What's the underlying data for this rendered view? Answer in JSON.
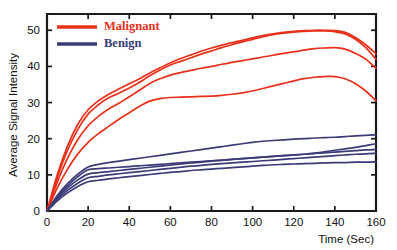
{
  "chart_data": {
    "type": "line",
    "title": "",
    "xlabel": "Time (Sec)",
    "ylabel": "Average Signal Intensity",
    "xlim": [
      0,
      160
    ],
    "ylim": [
      0,
      54.5
    ],
    "xticks": [
      0,
      20,
      40,
      60,
      80,
      100,
      120,
      140,
      160
    ],
    "xticklabels": [
      "0",
      "20",
      "40",
      "60",
      "80",
      "100",
      "120",
      "140",
      "160"
    ],
    "yticks": [
      0,
      10,
      20,
      30,
      40,
      50
    ],
    "yticklabels": [
      "0",
      "10",
      "20",
      "30",
      "40",
      "50"
    ],
    "grid": false,
    "legend_position": "upper left",
    "legend": [
      {
        "name": "Malignant",
        "color": "#E8301A"
      },
      {
        "name": "Benign",
        "color": "#3B3B78"
      }
    ],
    "colors": {
      "malignant": "#E8301A",
      "benign": "#3B3B78",
      "axis": "#1a1a1a",
      "background": "#ffffff"
    },
    "x": [
      0,
      5,
      10,
      15,
      20,
      25,
      30,
      35,
      40,
      45,
      50,
      55,
      60,
      65,
      70,
      75,
      80,
      85,
      90,
      95,
      100,
      105,
      110,
      115,
      120,
      125,
      130,
      135,
      140,
      145,
      150,
      155,
      160
    ],
    "series": [
      {
        "name": "Malignant 1",
        "group": "Malignant",
        "color": "#E8301A",
        "values": [
          0,
          10.0,
          18.0,
          24.0,
          28.0,
          30.5,
          32.3,
          33.8,
          35.2,
          36.6,
          38.2,
          39.6,
          41.0,
          42.2,
          43.2,
          44.2,
          45.1,
          45.9,
          46.6,
          47.2,
          47.9,
          48.5,
          49.0,
          49.4,
          49.7,
          49.9,
          50.0,
          50.0,
          49.9,
          49.4,
          48.0,
          46.0,
          43.5
        ]
      },
      {
        "name": "Malignant 2",
        "group": "Malignant",
        "color": "#E8301A",
        "values": [
          0,
          9.2,
          16.8,
          22.6,
          26.8,
          29.4,
          31.3,
          32.6,
          34.0,
          35.6,
          37.4,
          39.0,
          40.4,
          41.4,
          42.4,
          43.4,
          44.3,
          45.2,
          46.0,
          46.8,
          47.5,
          48.2,
          48.8,
          49.2,
          49.5,
          49.7,
          49.8,
          49.8,
          49.6,
          49.0,
          47.5,
          45.2,
          42.0
        ]
      },
      {
        "name": "Malignant 3",
        "group": "Malignant",
        "color": "#E8301A",
        "values": [
          0,
          8.0,
          14.6,
          19.8,
          23.6,
          26.2,
          28.2,
          29.8,
          31.6,
          33.4,
          35.3,
          36.6,
          37.6,
          38.3,
          38.9,
          39.5,
          40.0,
          40.6,
          41.1,
          41.6,
          42.1,
          42.6,
          43.1,
          43.6,
          44.0,
          44.5,
          44.9,
          45.1,
          45.2,
          44.8,
          43.6,
          42.0,
          39.5
        ]
      },
      {
        "name": "Malignant 4",
        "group": "Malignant",
        "color": "#E8301A",
        "values": [
          0,
          6.4,
          11.6,
          15.8,
          19.0,
          21.4,
          23.4,
          25.4,
          27.2,
          29.0,
          30.4,
          31.1,
          31.4,
          31.5,
          31.6,
          31.7,
          31.8,
          32.0,
          32.3,
          32.7,
          33.2,
          33.9,
          34.6,
          35.3,
          36.0,
          36.6,
          37.0,
          37.2,
          37.2,
          36.6,
          35.2,
          33.2,
          30.5
        ]
      },
      {
        "name": "Benign 1",
        "group": "Benign",
        "color": "#3B3B78",
        "values": [
          0,
          4.3,
          7.6,
          10.2,
          12.2,
          12.9,
          13.4,
          13.8,
          14.2,
          14.6,
          15.0,
          15.4,
          15.8,
          16.2,
          16.6,
          17.0,
          17.4,
          17.8,
          18.2,
          18.6,
          19.0,
          19.3,
          19.5,
          19.7,
          19.9,
          20.0,
          20.2,
          20.3,
          20.4,
          20.6,
          20.8,
          20.9,
          21.1
        ]
      },
      {
        "name": "Benign 2",
        "group": "Benign",
        "color": "#3B3B78",
        "values": [
          0,
          3.9,
          7.0,
          9.5,
          11.4,
          11.7,
          11.9,
          12.1,
          12.3,
          12.5,
          12.7,
          12.9,
          13.1,
          13.3,
          13.5,
          13.7,
          13.9,
          14.1,
          14.3,
          14.5,
          14.7,
          14.9,
          15.1,
          15.3,
          15.5,
          15.7,
          16.0,
          16.4,
          16.8,
          17.2,
          17.6,
          18.1,
          18.6
        ]
      },
      {
        "name": "Benign 3",
        "group": "Benign",
        "color": "#3B3B78",
        "values": [
          0,
          3.6,
          6.4,
          8.6,
          10.2,
          10.6,
          10.9,
          11.2,
          11.5,
          11.8,
          12.1,
          12.4,
          12.7,
          13.0,
          13.3,
          13.5,
          13.8,
          14.0,
          14.3,
          14.5,
          14.7,
          14.9,
          15.1,
          15.3,
          15.5,
          15.7,
          15.9,
          16.1,
          16.3,
          16.5,
          16.7,
          16.9,
          17.0
        ]
      },
      {
        "name": "Benign 4",
        "group": "Benign",
        "color": "#3B3B78",
        "values": [
          0,
          3.2,
          5.7,
          7.7,
          9.2,
          9.6,
          10.0,
          10.3,
          10.6,
          10.9,
          11.2,
          11.5,
          11.8,
          12.1,
          12.4,
          12.6,
          12.9,
          13.1,
          13.3,
          13.5,
          13.7,
          13.9,
          14.1,
          14.3,
          14.5,
          14.7,
          14.9,
          15.1,
          15.3,
          15.5,
          15.7,
          15.8,
          16.0
        ]
      },
      {
        "name": "Benign 5",
        "group": "Benign",
        "color": "#3B3B78",
        "values": [
          0,
          2.8,
          5.0,
          6.8,
          8.1,
          8.5,
          8.9,
          9.2,
          9.5,
          9.8,
          10.1,
          10.4,
          10.7,
          10.9,
          11.2,
          11.4,
          11.6,
          11.8,
          12.0,
          12.2,
          12.4,
          12.6,
          12.8,
          12.9,
          13.0,
          13.1,
          13.2,
          13.3,
          13.4,
          13.4,
          13.5,
          13.5,
          13.6
        ]
      }
    ]
  }
}
